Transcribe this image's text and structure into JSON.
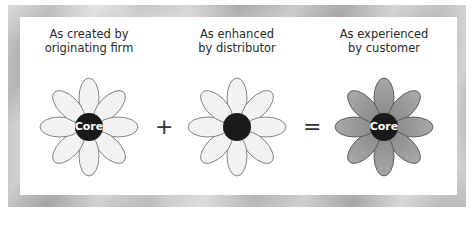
{
  "diagram": {
    "type": "flower-of-service",
    "stages": [
      {
        "heading_line1": "As created by",
        "heading_line2": "originating firm",
        "core_label": "Core",
        "petal_fill": "#f2f2f2",
        "core_fill": "#1a1a1a"
      },
      {
        "heading_line1": "As enhanced",
        "heading_line2": "by distributor",
        "core_label": "",
        "petal_fill": "#f2f2f2",
        "core_fill": "#1a1a1a"
      },
      {
        "heading_line1": "As experienced",
        "heading_line2": "by customer",
        "core_label": "Core",
        "petal_fill": "#9a9a9a",
        "core_fill": "#1a1a1a"
      }
    ],
    "operators": [
      "+",
      "="
    ],
    "petal_count": 8
  },
  "caption": {
    "text": ""
  }
}
